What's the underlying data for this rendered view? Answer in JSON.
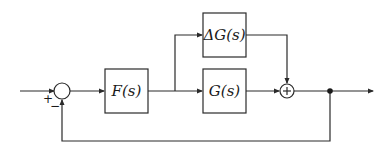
{
  "diagram": {
    "type": "feedback-control-block-diagram",
    "blocks": [
      {
        "id": "F",
        "label": "F(s)"
      },
      {
        "id": "G",
        "label": "G(s)"
      },
      {
        "id": "dG",
        "label": "ΔG(s)"
      }
    ],
    "summing_junctions": [
      {
        "id": "sum1",
        "signs": {
          "input": "+",
          "feedback": "−"
        }
      },
      {
        "id": "sum2",
        "symbol": "+"
      }
    ],
    "colors": {
      "line": "#2a2a2a",
      "background": "#ffffff"
    }
  }
}
